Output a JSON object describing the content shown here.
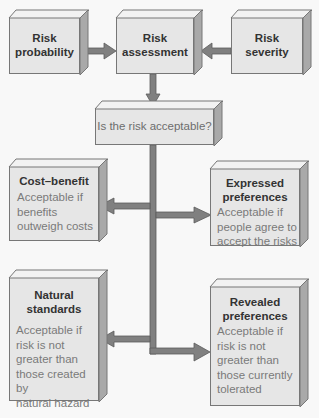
{
  "colors": {
    "background": "#f8f8f8",
    "box_face": "#e6e6e6",
    "box_side": "#a9a9a9",
    "box_top": "#f2f2f2",
    "box_border": "#777777",
    "arrow": "#808080",
    "arrow_outline": "#5a5a5a",
    "title_text": "#333333",
    "desc_text": "#7a7a7a"
  },
  "nodes": {
    "risk_probability": {
      "title": "Risk probability",
      "line1": "Risk",
      "line2": "probability"
    },
    "risk_assessment": {
      "title": "Risk assessment",
      "line1": "Risk",
      "line2": "assessment"
    },
    "risk_severity": {
      "title": "Risk severity",
      "line1": "Risk",
      "line2": "severity"
    },
    "question": {
      "text": "Is the risk acceptable?"
    },
    "cost_benefit": {
      "title": "Cost–benefit",
      "desc_lines": [
        "Acceptable if",
        "benefits",
        "outweigh costs"
      ]
    },
    "expressed_preferences": {
      "line1": "Expressed",
      "line2": "preferences",
      "desc_lines": [
        "Acceptable if",
        "people agree to",
        "accept the risks"
      ]
    },
    "natural_standards": {
      "line1": "Natural",
      "line2": "standards",
      "desc_lines": [
        "Acceptable if",
        "risk is not",
        "greater than",
        "those created by",
        "natural hazard"
      ]
    },
    "revealed_preferences": {
      "line1": "Revealed",
      "line2": "preferences",
      "desc_lines": [
        "Acceptable if",
        "risk is not",
        "greater than",
        "those currently",
        "tolerated"
      ]
    }
  },
  "edges": [
    {
      "from": "Risk probability",
      "to": "Risk assessment"
    },
    {
      "from": "Risk severity",
      "to": "Risk assessment"
    },
    {
      "from": "Risk assessment",
      "to": "Is the risk acceptable?"
    },
    {
      "from": "Is the risk acceptable?",
      "to": "Cost–benefit"
    },
    {
      "from": "Is the risk acceptable?",
      "to": "Expressed preferences"
    },
    {
      "from": "Is the risk acceptable?",
      "to": "Natural standards"
    },
    {
      "from": "Is the risk acceptable?",
      "to": "Revealed preferences"
    }
  ]
}
